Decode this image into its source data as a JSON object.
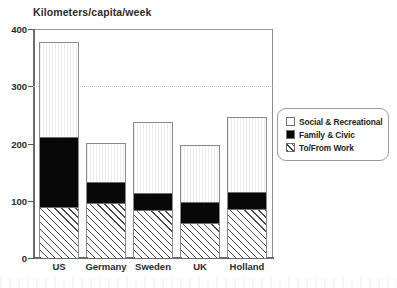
{
  "chart_data": {
    "type": "bar",
    "subtype": "stacked-bar",
    "title": "Kilometers/capita/week",
    "xlabel": "",
    "ylabel": "",
    "ylim": [
      0,
      400
    ],
    "yticks": [
      0,
      100,
      200,
      300,
      400
    ],
    "ytick_labels": [
      "0",
      "100",
      "200",
      "300",
      "400"
    ],
    "grid": "horizontal-dotted-at-300-only",
    "gridlines": [
      300
    ],
    "legend_position": "right-outside",
    "categories": [
      "US",
      "Germany",
      "Sweden",
      "UK",
      "Holland"
    ],
    "series": [
      {
        "name": "To/From Work",
        "fill": "diagonal-hatch",
        "color": "#ffffff",
        "values": [
          87,
          94,
          82,
          59,
          84
        ]
      },
      {
        "name": "Family & Civic",
        "fill": "solid",
        "color": "#080808",
        "values": [
          124,
          37,
          30,
          37,
          31
        ]
      },
      {
        "name": "Social & Recreational",
        "fill": "empty",
        "color": "#ffffff",
        "values": [
          166,
          69,
          125,
          101,
          132
        ]
      }
    ],
    "totals": [
      377,
      200,
      237,
      197,
      247
    ]
  },
  "legend": {
    "items": [
      {
        "label": "Social & Recreational",
        "swatch": "white-square-icon"
      },
      {
        "label": "Family & Civic",
        "swatch": "black-square-icon"
      },
      {
        "label": "To/From Work",
        "swatch": "hatched-square-icon"
      }
    ]
  },
  "colors": {
    "axis": "#6b6b6b",
    "frame": "#8d8d8d",
    "gridline": "#b8b8b8",
    "text": "#2b2b2b",
    "black_segment": "#080808",
    "background": "#ffffff"
  }
}
